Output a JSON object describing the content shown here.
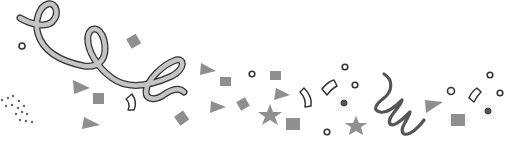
{
  "illustration": {
    "subject": "confetti and streamers",
    "colors": {
      "background": "#ffffff",
      "ribbon_fill": "#bdbdbd",
      "ribbon_stroke": "#333333",
      "confetti_fill": "#8c8c8c",
      "outline": "#2a2a2a",
      "dot": "#555555"
    }
  }
}
